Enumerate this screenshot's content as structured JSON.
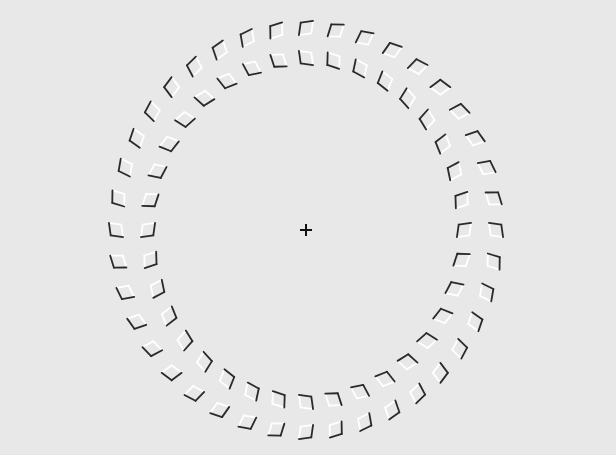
{
  "figure": {
    "type": "optical-illusion",
    "background": "#e8e8e8",
    "dark_edge_color": "#2a2a2a",
    "light_edge_color": "#ffffff",
    "fixation_cross": {
      "cx": 306,
      "cy": 230,
      "size": 12,
      "color": "#111111"
    },
    "rings": [
      {
        "name": "outer",
        "cx": 306,
        "cy": 230,
        "rx": 190,
        "ry": 202,
        "count": 40,
        "tilt_deg": 45,
        "size": 10,
        "dark_sides": "inner"
      },
      {
        "name": "inner",
        "cx": 306,
        "cy": 230,
        "rx": 158,
        "ry": 172,
        "count": 36,
        "tilt_deg": -45,
        "size": 10,
        "dark_sides": "inner"
      }
    ]
  }
}
